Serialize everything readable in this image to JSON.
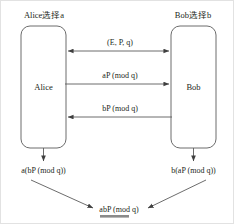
{
  "diagram": {
    "title_left": "Alice选择a",
    "title_right": "Bob选择b",
    "nodes": {
      "left": "Alice",
      "right": "Bob"
    },
    "messages": [
      {
        "id": "params",
        "label": "(E, P, q)",
        "direction": "bidirectional"
      },
      {
        "id": "alice-public",
        "label": "aP (mod q)",
        "direction": "left-to-right"
      },
      {
        "id": "bob-public",
        "label": "bP (mod q)",
        "direction": "right-to-left"
      }
    ],
    "results": {
      "left": "a(bP (mod q))",
      "right": "b(aP (mod q))",
      "shared": "abP (mod q)"
    },
    "colors": {
      "stroke": "#5b5b5b",
      "text": "#231f20",
      "underline": "#8a8a8a",
      "background": "#ffffff",
      "frame": "#e2e2e2"
    }
  }
}
